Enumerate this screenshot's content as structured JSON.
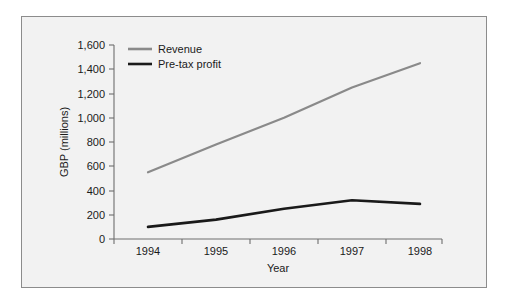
{
  "chart_data": {
    "type": "line",
    "title": "",
    "xlabel": "Year",
    "ylabel": "GBP (millions)",
    "categories": [
      "1994",
      "1995",
      "1996",
      "1997",
      "1998"
    ],
    "x": [
      1994,
      1995,
      1996,
      1997,
      1998
    ],
    "xlim": [
      1993.5,
      1998.5
    ],
    "ylim": [
      0,
      1600
    ],
    "yticks": [
      "0",
      "200",
      "400",
      "600",
      "800",
      "1,000",
      "1,200",
      "1,400",
      "1,600"
    ],
    "ytick_values": [
      0,
      200,
      400,
      600,
      800,
      1000,
      1200,
      1400,
      1600
    ],
    "grid": false,
    "legend_position": "top-left-inside",
    "series": [
      {
        "name": "Revenue",
        "color": "#8a8a8a",
        "values": [
          550,
          780,
          1000,
          1250,
          1450
        ]
      },
      {
        "name": "Pre-tax profit",
        "color": "#1a1a1a",
        "values": [
          100,
          160,
          250,
          320,
          290
        ]
      }
    ]
  },
  "legend": {
    "items": [
      {
        "label": "Revenue",
        "color": "#8a8a8a"
      },
      {
        "label": "Pre-tax profit",
        "color": "#1a1a1a"
      }
    ]
  },
  "axes": {
    "y_title": "GBP (millions)",
    "x_title": "Year",
    "y_tick_labels": [
      "1,600",
      "1,400",
      "1,200",
      "1,000",
      "800",
      "600",
      "400",
      "200",
      "0"
    ],
    "x_tick_labels": [
      "1994",
      "1995",
      "1996",
      "1997",
      "1998"
    ]
  },
  "colors": {
    "frame_border": "#8c8c8c",
    "plot_background": "#f2f2f2",
    "axis": "#6e6e6e",
    "revenue": "#8a8a8a",
    "profit": "#1a1a1a"
  }
}
